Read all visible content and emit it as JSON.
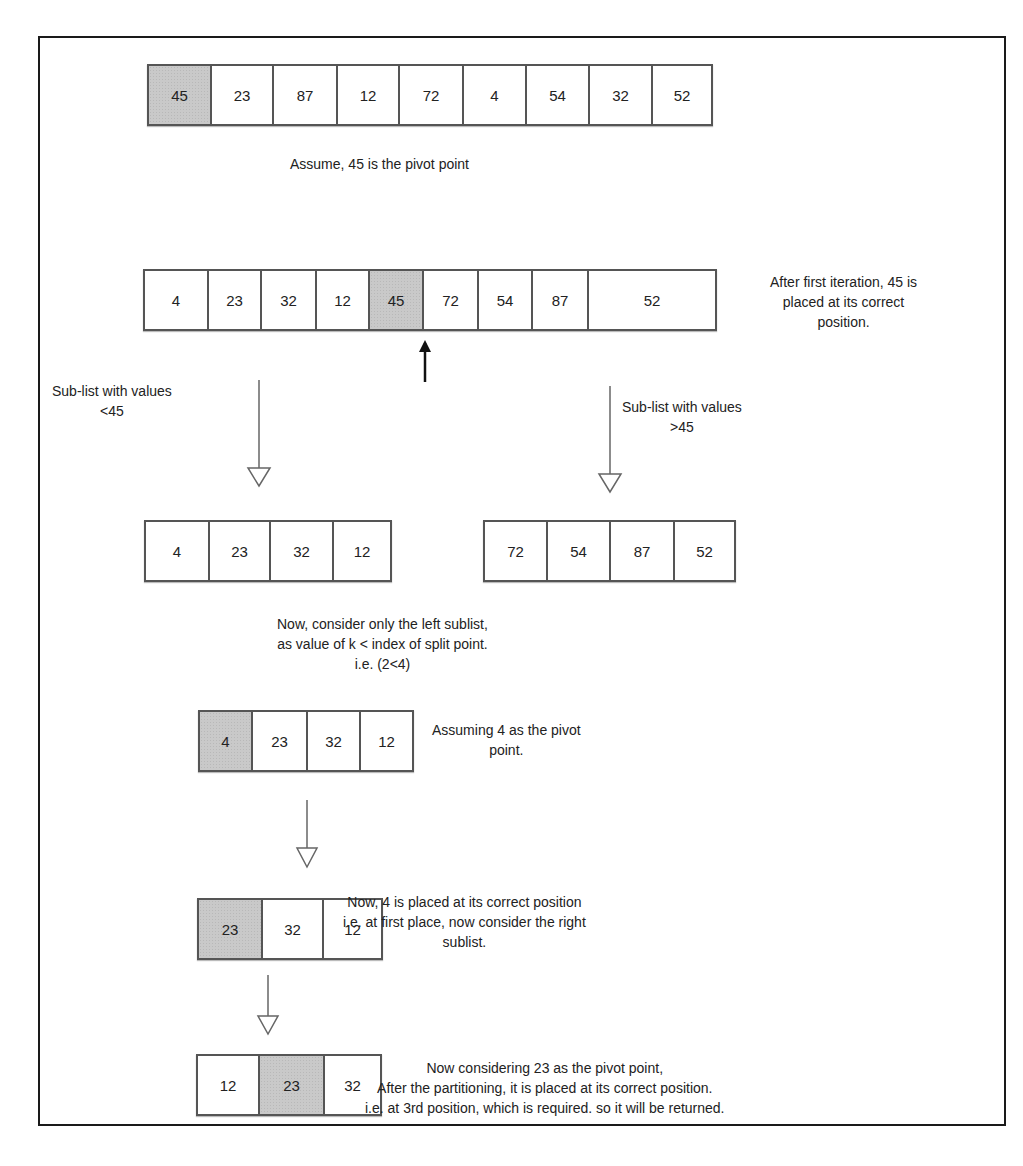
{
  "diagram": {
    "steps": [
      {
        "id": "initial",
        "values": [
          "45",
          "23",
          "87",
          "12",
          "72",
          "4",
          "54",
          "32",
          "52"
        ],
        "pivot_index": 0,
        "note": [
          "Assume, 45 is the pivot point"
        ]
      },
      {
        "id": "after-first-iteration",
        "values": [
          "4",
          "23",
          "32",
          "12",
          "45",
          "72",
          "54",
          "87",
          "52"
        ],
        "pivot_index": 4,
        "note": [
          "After first iteration, 45 is",
          "placed at its correct",
          "position."
        ]
      },
      {
        "id": "left-sublist",
        "values": [
          "4",
          "23",
          "32",
          "12"
        ],
        "pivot_index": null,
        "label": [
          "Sub-list with values",
          "<45"
        ]
      },
      {
        "id": "right-sublist",
        "values": [
          "72",
          "54",
          "87",
          "52"
        ],
        "pivot_index": null,
        "label": [
          "Sub-list with values",
          ">45"
        ]
      },
      {
        "id": "consider-left",
        "note": [
          "Now, consider only the left sublist,",
          "as value of k < index of split point.",
          "i.e. (2<4)"
        ]
      },
      {
        "id": "pivot-4",
        "values": [
          "4",
          "23",
          "32",
          "12"
        ],
        "pivot_index": 0,
        "note": [
          "Assuming 4 as the pivot",
          "point."
        ]
      },
      {
        "id": "right-of-4",
        "values": [
          "23",
          "32",
          "12"
        ],
        "pivot_index": 0,
        "note": [
          "Now, 4 is placed at its correct position",
          "i.e. at first place, now consider the right",
          "sublist."
        ]
      },
      {
        "id": "final",
        "values": [
          "12",
          "23",
          "32"
        ],
        "pivot_index": 1,
        "note": [
          "Now considering 23 as the pivot point,",
          "After the partitioning, it is placed at its correct position.",
          "i.e. at 3rd position, which is required. so it will be returned."
        ]
      }
    ],
    "colors": {
      "pivot_fill": "#c9c9c9",
      "border": "#555555",
      "frame": "#1a1a1a",
      "text": "#222222"
    }
  }
}
